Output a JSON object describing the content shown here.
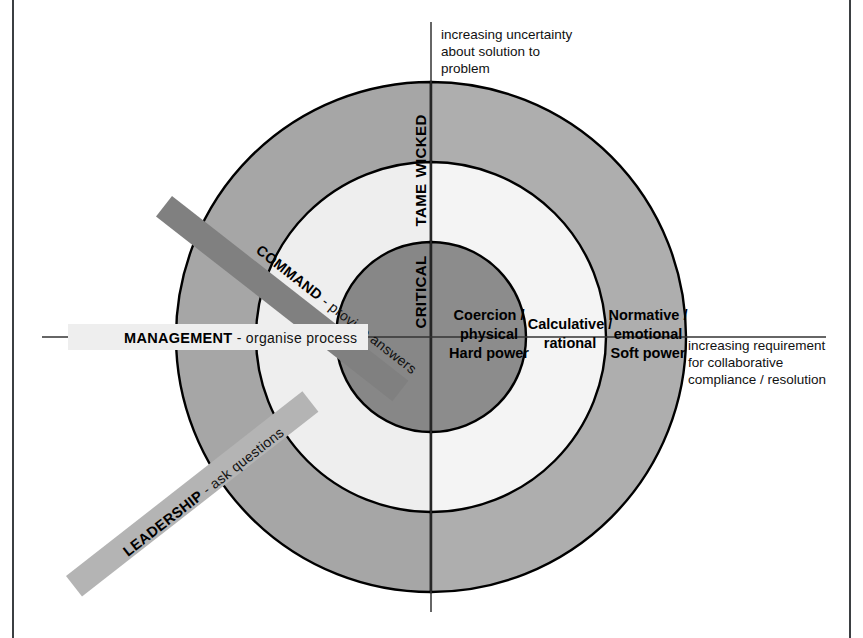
{
  "diagram": {
    "axes": {
      "vertical_note": "increasing uncertainty\nabout solution to\nproblem",
      "horizontal_note": "increasing requirement\nfor collaborative\ncompliance / resolution"
    },
    "rings": [
      {
        "key": "wicked",
        "label": "WICKED",
        "color_left": "#a8a8a8",
        "color_right": "#b0b0b0"
      },
      {
        "key": "tame",
        "label": "TAME",
        "color_left": "#efefef",
        "color_right": "#f3f3f3"
      },
      {
        "key": "critical",
        "label": "CRITICAL",
        "color_left": "#898989",
        "color_right": "#8d8d8d"
      }
    ],
    "power_labels": [
      {
        "key": "hard",
        "lines": "Coercion /|physical|Hard power"
      },
      {
        "key": "calculative",
        "lines": "Calculative /|rational"
      },
      {
        "key": "soft",
        "lines": "Normative /|emotional|Soft power"
      }
    ],
    "power_hard_l1": "Coercion /",
    "power_hard_l2": "physical",
    "power_hard_l3": "Hard power",
    "power_calc_l1": "Calculative /",
    "power_calc_l2": "rational",
    "power_soft_l1": "Normative /",
    "power_soft_l2": "emotional",
    "power_soft_l3": "Soft power",
    "banners": [
      {
        "key": "command",
        "strong": "COMMAND",
        "light": " - provide answers",
        "color": "#808080"
      },
      {
        "key": "management",
        "strong": "MANAGEMENT",
        "light": " - organise process",
        "color": "#eeeeee"
      },
      {
        "key": "leadership",
        "strong": "LEADERSHIP",
        "light": " - ask questions",
        "color": "#b4b4b4"
      }
    ],
    "banner_command_strong": "COMMAND",
    "banner_command_light": " - provide answers",
    "banner_management_strong": "MANAGEMENT",
    "banner_management_light": " - organise process",
    "banner_leadership_strong": "LEADERSHIP",
    "banner_leadership_light": " - ask questions",
    "ring_label_wicked": "WICKED",
    "ring_label_tame": "TAME",
    "ring_label_critical": "CRITICAL",
    "colors": {
      "outer_ring": "#a9a9a9",
      "middle_ring": "#f0f0f0",
      "inner_circle": "#8a8a8a",
      "stroke": "#000000",
      "frame": "#3b3f42",
      "axis": "#333333"
    },
    "geometry": {
      "center_x": 431,
      "center_y": 337,
      "r_outer": 255,
      "r_middle": 175,
      "r_inner": 95
    }
  }
}
